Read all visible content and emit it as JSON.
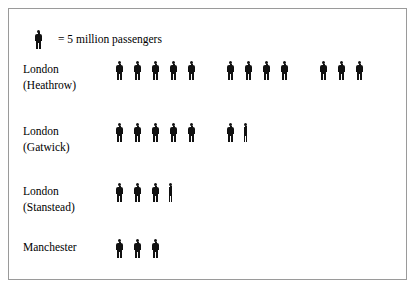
{
  "chart_data": {
    "type": "pictogram",
    "title": "",
    "xlabel": "",
    "ylabel": "",
    "unit_value": 5,
    "unit_label": "million passengers",
    "legend": {
      "icon": "person-icon",
      "text": "= 5 million passengers"
    },
    "categories": [
      "London (Heathrow)",
      "London (Gatwick)",
      "London (Stanstead)",
      "Manchester"
    ],
    "values": [
      60,
      32.5,
      16.5,
      15
    ],
    "rows": [
      {
        "label_line1": "London",
        "label_line2": "(Heathrow)",
        "full_icons": 12,
        "partial_fraction": 0,
        "groups": [
          5,
          4,
          3
        ],
        "value": 60
      },
      {
        "label_line1": "London",
        "label_line2": "(Gatwick)",
        "full_icons": 6,
        "partial_fraction": 0.33,
        "groups": [
          5,
          1
        ],
        "value": 32.5
      },
      {
        "label_line1": "London",
        "label_line2": "(Stanstead)",
        "full_icons": 3,
        "partial_fraction": 0.33,
        "groups": [
          3
        ],
        "value": 16.5
      },
      {
        "label_line1": "Manchester",
        "label_line2": "",
        "full_icons": 3,
        "partial_fraction": 0,
        "groups": [
          3
        ],
        "value": 15
      }
    ],
    "colors": {
      "icon": "#111111",
      "border": "#9a9a9a",
      "background": "#ffffff",
      "text": "#000000"
    }
  }
}
